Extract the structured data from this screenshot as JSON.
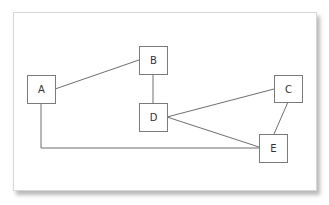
{
  "diagram": {
    "type": "graph",
    "nodes": [
      {
        "id": "A",
        "label": "A",
        "x": 27,
        "y": 75,
        "w": 29,
        "h": 29
      },
      {
        "id": "B",
        "label": "B",
        "x": 139,
        "y": 46,
        "w": 29,
        "h": 29
      },
      {
        "id": "C",
        "label": "C",
        "x": 274,
        "y": 75,
        "w": 29,
        "h": 28
      },
      {
        "id": "D",
        "label": "D",
        "x": 139,
        "y": 103,
        "w": 29,
        "h": 29
      },
      {
        "id": "E",
        "label": "E",
        "x": 259,
        "y": 134,
        "w": 29,
        "h": 29
      }
    ],
    "edges": [
      {
        "from": "A",
        "to": "B",
        "points": "55,89 139,60"
      },
      {
        "from": "B",
        "to": "D",
        "points": "153,74 153,103"
      },
      {
        "from": "D",
        "to": "C",
        "points": "167,117 274,89"
      },
      {
        "from": "D",
        "to": "E",
        "points": "167,117 259,147"
      },
      {
        "from": "C",
        "to": "E",
        "points": "288,102 274,134"
      },
      {
        "from": "A",
        "to": "E",
        "points": "41,103 41,148 259,148"
      }
    ],
    "colors": {
      "node_border": "#7a7a7a",
      "edge": "#6e6e6e",
      "text": "#333333",
      "background": "#ffffff"
    }
  }
}
